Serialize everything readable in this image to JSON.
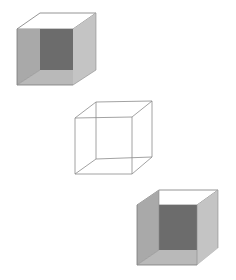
{
  "figure": {
    "colors": {
      "background": "#ffffff",
      "back_face": "#6c6c6c",
      "left_panel": "#a9a9a9",
      "right_panel": "#c4c4c4",
      "bottom_panel": "#b9b9b9",
      "top_open": "#ffffff",
      "edge": "#7a7a7a",
      "wire": "#8a8a8a"
    },
    "cubes": [
      {
        "name": "shaded-cube-top-left",
        "front": {
          "tl": [
            17,
            29
          ],
          "tr": [
            73,
            29
          ],
          "br": [
            73,
            85
          ],
          "bl": [
            17,
            85
          ]
        },
        "back": {
          "tl": [
            40,
            13
          ],
          "tr": [
            96,
            13
          ],
          "br": [
            96,
            70
          ],
          "bl": [
            40,
            70
          ]
        }
      },
      {
        "name": "wireframe-cube-middle",
        "front": {
          "tl": [
            75,
            118
          ],
          "tr": [
            132,
            117
          ],
          "br": [
            132,
            174
          ],
          "bl": [
            75,
            174
          ]
        },
        "back": {
          "tl": [
            96,
            102
          ],
          "tr": [
            152,
            101
          ],
          "br": [
            152,
            157
          ],
          "bl": [
            96,
            159
          ]
        }
      },
      {
        "name": "shaded-cube-bottom-right",
        "front": {
          "tl": [
            137,
            205
          ],
          "tr": [
            197,
            205
          ],
          "br": [
            197,
            265
          ],
          "bl": [
            137,
            265
          ]
        },
        "back": {
          "tl": [
            159,
            190
          ],
          "tr": [
            218,
            190
          ],
          "br": [
            218,
            248
          ],
          "bl": [
            159,
            250
          ]
        }
      }
    ]
  }
}
